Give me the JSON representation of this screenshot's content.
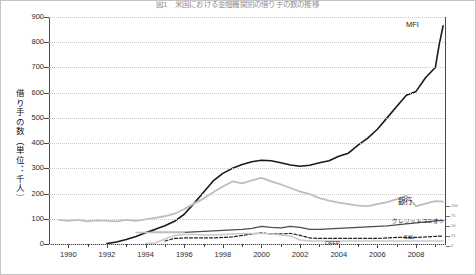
{
  "chart_data": {
    "type": "line",
    "title": "図1　米国における金融機関別の借り手の数の推移",
    "xlabel": "",
    "ylabel": "借り手の数（単位：千人）",
    "xlim": [
      1989,
      2009.5
    ],
    "ylim": [
      0,
      900
    ],
    "grid": true,
    "legend_position": "inline-right",
    "xticks": [
      "1990",
      "1992",
      "1994",
      "1996",
      "1998",
      "2000",
      "2002",
      "2004",
      "2006",
      "2008"
    ],
    "yticks": [
      "0",
      "100",
      "200",
      "300",
      "400",
      "500",
      "600",
      "700",
      "800",
      "900"
    ],
    "secondary_axis_ticks": [
      "100",
      "75",
      "50",
      "25",
      "0"
    ],
    "annotations": [
      "MFI",
      "銀行",
      "クレジットユニオン",
      "S&L",
      "OFFP"
    ],
    "series": [
      {
        "name": "MFI",
        "label": "MFI",
        "color": "#1a1a1a",
        "style": "solid",
        "width": 1.6,
        "x": [
          1992.0,
          1992.5,
          1993.0,
          1993.5,
          1994.0,
          1994.5,
          1995.0,
          1995.5,
          1996.0,
          1996.5,
          1997.0,
          1997.5,
          1998.0,
          1998.5,
          1999.0,
          1999.5,
          2000.0,
          2000.5,
          2001.0,
          2001.5,
          2002.0,
          2002.5,
          2003.0,
          2003.5,
          2004.0,
          2004.5,
          2005.0,
          2005.5,
          2006.0,
          2006.5,
          2007.0,
          2007.5,
          2008.0,
          2008.5,
          2009.0
        ],
        "values": [
          2,
          8,
          18,
          30,
          45,
          58,
          72,
          90,
          118,
          160,
          205,
          250,
          280,
          300,
          315,
          326,
          332,
          330,
          322,
          313,
          308,
          312,
          322,
          330,
          348,
          360,
          392,
          420,
          455,
          500,
          545,
          590,
          605,
          660,
          700
        ]
      },
      {
        "name": "MFI_tail",
        "label": "",
        "color": "#1a1a1a",
        "style": "solid",
        "width": 1.6,
        "x": [
          2009.0,
          2009.2,
          2009.4
        ],
        "values": [
          700,
          790,
          865
        ]
      },
      {
        "name": "銀行",
        "label": "銀行",
        "color": "#bdbdbd",
        "style": "solid",
        "width": 1.8,
        "x": [
          1989.5,
          1990.0,
          1990.5,
          1991.0,
          1991.5,
          1992.0,
          1992.5,
          1993.0,
          1993.5,
          1994.0,
          1994.5,
          1995.0,
          1995.5,
          1996.0,
          1996.5,
          1997.0,
          1997.5,
          1998.0,
          1998.5,
          1999.0,
          1999.5,
          2000.0,
          2000.5,
          2001.0,
          2001.5,
          2002.0,
          2002.5,
          2003.0,
          2003.5,
          2004.0,
          2004.5,
          2005.0,
          2005.5,
          2006.0,
          2006.5,
          2007.0,
          2007.5,
          2008.0,
          2008.5,
          2009.0,
          2009.4
        ],
        "values": [
          96,
          92,
          96,
          90,
          94,
          92,
          90,
          96,
          92,
          98,
          104,
          110,
          120,
          138,
          160,
          180,
          205,
          228,
          248,
          240,
          252,
          262,
          248,
          236,
          222,
          208,
          198,
          182,
          172,
          164,
          158,
          152,
          150,
          158,
          166,
          178,
          192,
          150,
          160,
          170,
          168
        ]
      },
      {
        "name": "クレジットユニオン",
        "label": "クレジットユニオン",
        "color": "#4d4d4d",
        "style": "solid",
        "width": 1.3,
        "x": [
          1994.0,
          1994.5,
          1995.0,
          1995.5,
          1996.0,
          1996.5,
          1997.0,
          1997.5,
          1998.0,
          1998.5,
          1999.0,
          1999.5,
          2000.0,
          2000.5,
          2001.0,
          2001.5,
          2002.0,
          2002.5,
          2003.0,
          2003.5,
          2004.0,
          2004.5,
          2005.0,
          2005.5,
          2006.0,
          2006.5,
          2007.0,
          2007.5,
          2008.0,
          2008.5,
          2009.0,
          2009.4
        ],
        "values": [
          46,
          46,
          46,
          46,
          46,
          48,
          50,
          52,
          54,
          56,
          58,
          62,
          70,
          66,
          64,
          70,
          66,
          58,
          58,
          60,
          62,
          64,
          66,
          68,
          70,
          72,
          76,
          80,
          84,
          88,
          92,
          94
        ]
      },
      {
        "name": "S&L",
        "label": "S&L",
        "color": "#222222",
        "style": "dashed",
        "width": 1.2,
        "x": [
          1995.0,
          1995.5,
          1996.0,
          1996.5,
          1997.0,
          1997.5,
          1998.0,
          1998.5,
          1999.0,
          1999.5,
          2000.0,
          2000.5,
          2001.0,
          2001.5,
          2002.0,
          2002.5,
          2003.0,
          2003.5,
          2004.0,
          2004.5,
          2005.0,
          2005.5,
          2006.0,
          2006.5,
          2007.0,
          2007.5,
          2008.0,
          2008.5,
          2009.0,
          2009.4
        ],
        "values": [
          12,
          22,
          24,
          24,
          24,
          24,
          26,
          28,
          34,
          40,
          44,
          40,
          40,
          42,
          34,
          24,
          22,
          22,
          22,
          22,
          22,
          22,
          22,
          24,
          26,
          26,
          26,
          28,
          30,
          32
        ]
      },
      {
        "name": "OFFP",
        "label": "OFFP",
        "color": "#c9c9c9",
        "style": "solid",
        "width": 1.5,
        "x": [
          1994.0,
          1994.5,
          1995.0,
          1995.5,
          1996.0,
          1996.5,
          1997.0,
          1997.5,
          1998.0,
          1998.5,
          1999.0,
          1999.5,
          2000.0,
          2000.5,
          2001.0,
          2001.5,
          2002.0,
          2002.5,
          2003.0,
          2003.5,
          2004.0,
          2004.5,
          2005.0,
          2005.5,
          2006.0,
          2006.5,
          2007.0,
          2007.5,
          2008.0,
          2008.5,
          2009.0,
          2009.4
        ],
        "values": [
          2,
          4,
          20,
          34,
          38,
          38,
          36,
          36,
          38,
          40,
          42,
          42,
          42,
          40,
          36,
          32,
          16,
          12,
          12,
          12,
          12,
          12,
          12,
          12,
          12,
          12,
          12,
          12,
          12,
          12,
          12,
          12
        ]
      },
      {
        "name": "MFI_early",
        "label": "",
        "color": "#bdbdbd",
        "style": "solid",
        "width": 1.5,
        "x": [
          1993.5,
          1994.0,
          1994.5,
          1995.0,
          1995.5,
          1996.0
        ],
        "values": [
          46,
          46,
          46,
          46,
          46,
          46
        ]
      }
    ]
  },
  "labels": {
    "mfi": "MFI",
    "bank": "銀行",
    "credit_union": "クレジットユニオン",
    "snl": "S&L",
    "offp": "OFFP"
  },
  "mini_axis": {
    "ticks": [
      "100",
      "75",
      "50",
      "25",
      "0"
    ]
  }
}
